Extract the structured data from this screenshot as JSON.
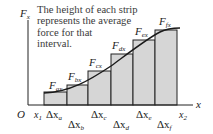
{
  "caption": {
    "lines": [
      "The height of each strip",
      "represents the average",
      "force for that",
      "interval."
    ]
  },
  "axes": {
    "y_label": "F",
    "y_label_sub": "x",
    "x_label": "x",
    "origin_label": "O",
    "x_start_label": "x",
    "x_start_sub": "1",
    "x_end_label": "x",
    "x_end_sub": "2"
  },
  "strips": [
    {
      "force_label": "F",
      "force_sub": "ax",
      "delta_label": "Δx",
      "delta_sub": "a"
    },
    {
      "force_label": "F",
      "force_sub": "bx",
      "delta_label": "Δx",
      "delta_sub": "b"
    },
    {
      "force_label": "F",
      "force_sub": "cx",
      "delta_label": "Δx",
      "delta_sub": "c"
    },
    {
      "force_label": "F",
      "force_sub": "dx",
      "delta_label": "Δx",
      "delta_sub": "d"
    },
    {
      "force_label": "F",
      "force_sub": "ex",
      "delta_label": "Δx",
      "delta_sub": "e"
    },
    {
      "force_label": "F",
      "force_sub": "fx",
      "delta_label": "Δx",
      "delta_sub": "f"
    }
  ],
  "colors": {
    "strip_fill": "#d6d6d6",
    "line": "#222222",
    "text": "#3a3a3a"
  }
}
